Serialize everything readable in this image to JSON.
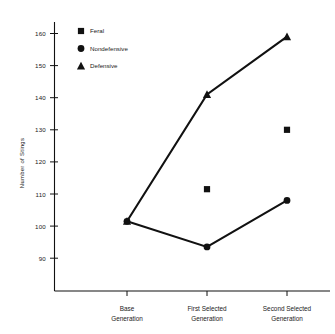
{
  "chart_data": {
    "type": "line",
    "title": "",
    "xlabel": "",
    "ylabel": "Number of Stings",
    "categories": [
      "Base Generation",
      "First Selected Generation",
      "Second Selected Generation"
    ],
    "category_lines": [
      [
        "Base",
        "Generation"
      ],
      [
        "First Selected",
        "Generation"
      ],
      [
        "Second Selected",
        "Generation"
      ]
    ],
    "ylim": [
      84,
      165
    ],
    "yticks": [
      90,
      100,
      110,
      120,
      130,
      140,
      150,
      160
    ],
    "ytick_labels": [
      "90",
      "100",
      "110",
      "120",
      "130",
      "140",
      "150",
      "160"
    ],
    "grid": false,
    "legend_position": "upper-left-inside",
    "series": [
      {
        "name": "Feral",
        "marker": "square",
        "line": false,
        "x": [
          "First Selected Generation",
          "Second Selected Generation"
        ],
        "values": [
          111.5,
          130.0
        ]
      },
      {
        "name": "Nondefensive",
        "marker": "circle",
        "line": true,
        "x": [
          "Base Generation",
          "First Selected Generation",
          "Second Selected Generation"
        ],
        "values": [
          101.5,
          93.5,
          108.0
        ]
      },
      {
        "name": "Defensive",
        "marker": "triangle",
        "line": true,
        "x": [
          "Base Generation",
          "First Selected Generation",
          "Second Selected Generation"
        ],
        "values": [
          101.5,
          141.0,
          159.0
        ]
      }
    ],
    "colors": {
      "ink": "#111111",
      "background": "#ffffff"
    }
  },
  "legend": {
    "items": [
      {
        "label": "Feral",
        "marker": "square"
      },
      {
        "label": "Nondefensive",
        "marker": "circle"
      },
      {
        "label": "Defensive",
        "marker": "triangle"
      }
    ]
  },
  "axes": {
    "y_title": "Number of Stings",
    "y_labels": [
      "160",
      "150",
      "140",
      "130",
      "120",
      "110",
      "100",
      "90"
    ],
    "x_labels_top": [
      "Base",
      "First Selected",
      "Second Selected"
    ],
    "x_labels_bottom": [
      "Generation",
      "Generation",
      "Generation"
    ]
  }
}
